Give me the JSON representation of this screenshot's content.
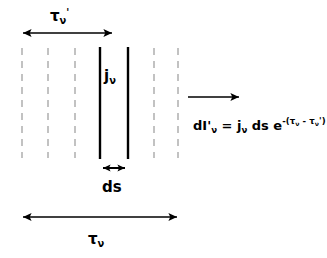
{
  "figure": {
    "type": "radiative-transfer-slab-diagram",
    "background_color": "#ffffff",
    "ink_color": "#000000",
    "dashed_line_color": "#b3b3b3"
  },
  "labels": {
    "tau_prime": "τ",
    "tau_prime_sub": "ν",
    "tau_prime_sup": "'",
    "emissivity": "j",
    "emissivity_sub": "ν",
    "ds": "ds",
    "tau": "τ",
    "tau_sub": "ν"
  },
  "equation": {
    "lhs": "dI'",
    "lhs_sub": "ν",
    "equals": " = j",
    "rhs_sub": "ν",
    "rhs_mid": " ds e",
    "exponent": "-(τ",
    "exponent_sub1": "ν",
    "exponent_mid": " - τ",
    "exponent_sub2": "ν",
    "exponent_end": "')",
    "full_text": "dI'ν = jν ds e^-(τν - τν')"
  },
  "geometry": {
    "dashed_lines_x": [
      22,
      48,
      75,
      154,
      178
    ],
    "solid_lines_x": [
      100,
      128
    ],
    "lines_y_top": 48,
    "lines_y_bottom": 158,
    "tau_prime_arrow": {
      "x1": 22,
      "x2": 113,
      "y": 33,
      "heads": "both"
    },
    "tau_arrow": {
      "x1": 22,
      "x2": 178,
      "y": 217,
      "heads": "both"
    },
    "ds_arrow": {
      "x1": 102,
      "x2": 126,
      "y": 168,
      "heads": "both"
    },
    "ray_arrow": {
      "x1": 188,
      "x2": 240,
      "y": 97,
      "heads": "right"
    }
  }
}
